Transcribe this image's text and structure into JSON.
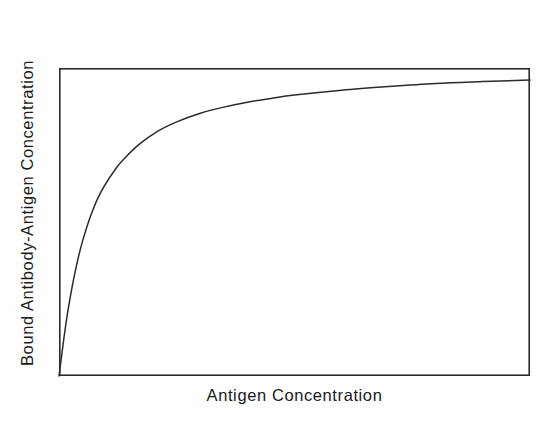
{
  "figure": {
    "background_color": "#fefefe",
    "plot_background_color": "#ffffff",
    "frame_color": "#2b2b2b",
    "curve_color": "#2b2b2b"
  },
  "axis": {
    "x_title": "Antigen Concentration",
    "y_title": "Bound Antibody-Antigen Concentration"
  },
  "chart_data": {
    "type": "line",
    "title": "",
    "subtitle": "",
    "xlabel": "Antigen Concentration",
    "ylabel": "Bound Antibody-Antigen Concentration",
    "xlim": [
      0,
      1
    ],
    "ylim": [
      0,
      1
    ],
    "grid": false,
    "legend": false,
    "legend_position": "none",
    "axis_tick_labels": {
      "x": [],
      "y": []
    },
    "annotations": [],
    "series": [
      {
        "name": "Bound antibody-antigen complex",
        "color": "#2b2b2b",
        "x": [
          0.0,
          0.01,
          0.02,
          0.035,
          0.05,
          0.07,
          0.09,
          0.12,
          0.14,
          0.17,
          0.21,
          0.25,
          0.3,
          0.35,
          0.4,
          0.45,
          0.5,
          0.6,
          0.7,
          0.8,
          0.9,
          1.0
        ],
        "y": [
          0.0,
          0.118,
          0.222,
          0.344,
          0.438,
          0.532,
          0.6,
          0.672,
          0.708,
          0.752,
          0.795,
          0.825,
          0.853,
          0.873,
          0.889,
          0.901,
          0.912,
          0.928,
          0.94,
          0.95,
          0.956,
          0.961
        ]
      }
    ]
  }
}
